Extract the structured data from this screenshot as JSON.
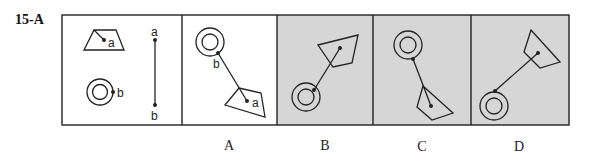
{
  "question": {
    "number": "15-A"
  },
  "panels": {
    "prompt": {
      "labels": {
        "a": "a",
        "b": "b"
      }
    },
    "options": [
      {
        "label": "A",
        "background": "#ffffff",
        "point_labels": {
          "a": "a",
          "b": "b"
        }
      },
      {
        "label": "B",
        "background": "#d6d6d6"
      },
      {
        "label": "C",
        "background": "#d6d6d6"
      },
      {
        "label": "D",
        "background": "#d6d6d6"
      }
    ]
  },
  "colors": {
    "stroke": "#222222",
    "shaded": "#d6d6d6",
    "plain": "#ffffff"
  }
}
